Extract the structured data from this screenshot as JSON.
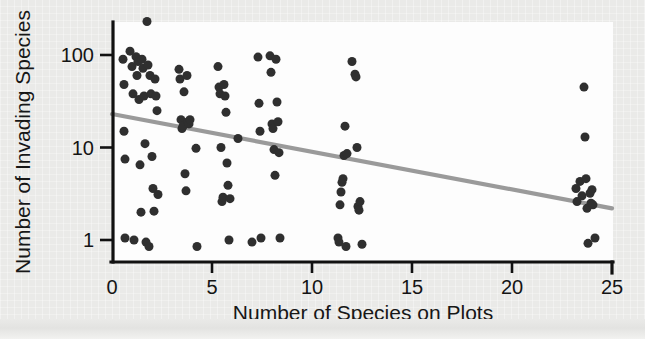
{
  "figure": {
    "background_color": "#eaeae8",
    "plot_background_color": "#fdfdfd",
    "axis_color": "#111111",
    "marker_color": "#2f2f2f",
    "trend_color": "#9a9a9a"
  },
  "chart_data": {
    "type": "scatter",
    "title": "",
    "xlabel": "Number of Species on Plots",
    "ylabel": "Number of Invading Species",
    "xscale": "linear",
    "yscale": "log",
    "xlim": [
      0,
      25
    ],
    "ylim": [
      0.75,
      260
    ],
    "xticks": [
      0,
      5,
      10,
      15,
      20,
      25
    ],
    "xticklabels": [
      "0",
      "5",
      "10",
      "15",
      "20",
      "25"
    ],
    "yticks": [
      1,
      10,
      100
    ],
    "yticklabels": [
      "1",
      "10",
      "100"
    ],
    "grid": false,
    "legend": false,
    "marker": "filled-circle",
    "marker_size": 9,
    "points": [
      [
        0.55,
        90
      ],
      [
        0.6,
        48
      ],
      [
        0.6,
        15
      ],
      [
        0.65,
        7.5
      ],
      [
        0.65,
        1.05
      ],
      [
        0.9,
        110
      ],
      [
        1.0,
        75
      ],
      [
        1.05,
        38
      ],
      [
        1.1,
        1.0
      ],
      [
        1.2,
        96
      ],
      [
        1.25,
        60
      ],
      [
        1.3,
        85
      ],
      [
        1.35,
        33
      ],
      [
        1.4,
        6.5
      ],
      [
        1.45,
        2.0
      ],
      [
        1.5,
        90
      ],
      [
        1.55,
        72
      ],
      [
        1.6,
        36
      ],
      [
        1.65,
        11
      ],
      [
        1.7,
        0.95
      ],
      [
        1.75,
        230
      ],
      [
        1.8,
        78
      ],
      [
        1.85,
        0.85
      ],
      [
        1.9,
        60
      ],
      [
        1.95,
        38
      ],
      [
        2.0,
        8.0
      ],
      [
        2.05,
        3.6
      ],
      [
        2.1,
        2.05
      ],
      [
        2.15,
        55
      ],
      [
        2.2,
        36
      ],
      [
        2.25,
        25
      ],
      [
        2.3,
        3.1
      ],
      [
        3.35,
        70
      ],
      [
        3.4,
        55
      ],
      [
        3.45,
        20
      ],
      [
        3.5,
        16
      ],
      [
        3.55,
        17
      ],
      [
        3.6,
        40
      ],
      [
        3.65,
        5.2
      ],
      [
        3.7,
        3.4
      ],
      [
        3.75,
        60
      ],
      [
        3.8,
        19
      ],
      [
        3.85,
        18
      ],
      [
        3.9,
        20
      ],
      [
        4.2,
        9.8
      ],
      [
        4.25,
        0.85
      ],
      [
        5.3,
        75
      ],
      [
        5.35,
        45
      ],
      [
        5.4,
        38
      ],
      [
        5.45,
        10
      ],
      [
        5.5,
        2.6
      ],
      [
        5.55,
        2.9
      ],
      [
        5.6,
        48
      ],
      [
        5.65,
        36
      ],
      [
        5.7,
        24
      ],
      [
        5.75,
        6.8
      ],
      [
        5.8,
        3.9
      ],
      [
        5.85,
        1.0
      ],
      [
        5.9,
        2.8
      ],
      [
        6.3,
        12.5
      ],
      [
        7.0,
        0.95
      ],
      [
        7.3,
        95
      ],
      [
        7.35,
        30
      ],
      [
        7.4,
        15
      ],
      [
        7.45,
        1.05
      ],
      [
        7.9,
        98
      ],
      [
        7.95,
        65
      ],
      [
        8.0,
        18
      ],
      [
        8.05,
        16
      ],
      [
        8.1,
        9.5
      ],
      [
        8.15,
        5.0
      ],
      [
        8.2,
        90
      ],
      [
        8.25,
        31
      ],
      [
        8.3,
        19
      ],
      [
        8.35,
        8.8
      ],
      [
        8.4,
        1.05
      ],
      [
        11.3,
        1.05
      ],
      [
        11.35,
        0.95
      ],
      [
        11.4,
        2.4
      ],
      [
        11.45,
        3.3
      ],
      [
        11.5,
        4.2
      ],
      [
        11.55,
        4.6
      ],
      [
        11.6,
        8.2
      ],
      [
        11.65,
        17
      ],
      [
        11.7,
        0.85
      ],
      [
        11.75,
        8.6
      ],
      [
        12.0,
        85
      ],
      [
        12.15,
        62
      ],
      [
        12.2,
        58
      ],
      [
        12.25,
        10
      ],
      [
        12.3,
        2.3
      ],
      [
        12.35,
        2.1
      ],
      [
        12.4,
        2.6
      ],
      [
        12.5,
        0.9
      ],
      [
        23.2,
        3.6
      ],
      [
        23.25,
        2.6
      ],
      [
        23.4,
        4.3
      ],
      [
        23.5,
        3.0
      ],
      [
        23.6,
        45
      ],
      [
        23.65,
        13
      ],
      [
        23.7,
        4.6
      ],
      [
        23.75,
        2.2
      ],
      [
        23.8,
        0.92
      ],
      [
        23.9,
        3.2
      ],
      [
        23.95,
        2.5
      ],
      [
        24.0,
        3.5
      ],
      [
        24.05,
        2.4
      ],
      [
        24.15,
        1.05
      ]
    ],
    "trend": {
      "type": "linear-on-log-y",
      "x_start": 0,
      "y_start": 23,
      "x_end": 25,
      "y_end": 2.2,
      "description": "negative trend line"
    }
  }
}
